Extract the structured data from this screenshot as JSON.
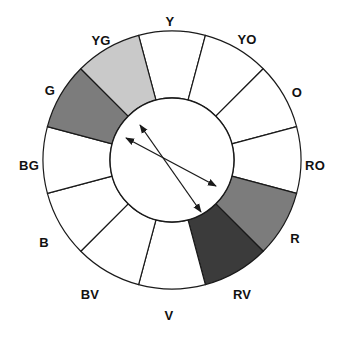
{
  "diagram": {
    "type": "color-wheel",
    "segment_count": 12,
    "geometry": {
      "center_x": 172,
      "center_y": 160,
      "outer_radius": 129,
      "inner_radius": 62,
      "start_angle_deg": -105,
      "segment_span_deg": 30
    },
    "colors": {
      "stroke": "#1a1a1a",
      "background": "#ffffff",
      "empty_segment": "#ffffff",
      "light_gray": "#c9c9c9",
      "medium_gray": "#7c7c7c",
      "dark_gray": "#3b3b3b",
      "label_text": "#111111"
    },
    "segments": [
      {
        "id": "Y",
        "label": "Y",
        "fill_key": "empty_segment",
        "fill": "#ffffff",
        "label_x": 170,
        "label_y": 21,
        "index": 0
      },
      {
        "id": "YO",
        "label": "YO",
        "fill_key": "empty_segment",
        "fill": "#ffffff",
        "label_x": 247,
        "label_y": 39,
        "index": 1
      },
      {
        "id": "O",
        "label": "O",
        "fill_key": "empty_segment",
        "fill": "#ffffff",
        "label_x": 297,
        "label_y": 92,
        "index": 2
      },
      {
        "id": "RO",
        "label": "RO",
        "fill_key": "empty_segment",
        "fill": "#ffffff",
        "label_x": 315,
        "label_y": 165,
        "index": 3
      },
      {
        "id": "R",
        "label": "R",
        "fill_key": "medium_gray",
        "fill": "#7c7c7c",
        "label_x": 295,
        "label_y": 238,
        "index": 4
      },
      {
        "id": "RV",
        "label": "RV",
        "fill_key": "dark_gray",
        "fill": "#3b3b3b",
        "label_x": 242,
        "label_y": 294,
        "index": 5
      },
      {
        "id": "V",
        "label": "V",
        "fill_key": "empty_segment",
        "fill": "#ffffff",
        "label_x": 169,
        "label_y": 315,
        "index": 6
      },
      {
        "id": "BV",
        "label": "BV",
        "fill_key": "empty_segment",
        "fill": "#ffffff",
        "label_x": 90,
        "label_y": 294,
        "index": 7
      },
      {
        "id": "B",
        "label": "B",
        "fill_key": "empty_segment",
        "fill": "#ffffff",
        "label_x": 44,
        "label_y": 242,
        "index": 8
      },
      {
        "id": "BG",
        "label": "BG",
        "fill_key": "empty_segment",
        "fill": "#ffffff",
        "label_x": 29,
        "label_y": 165,
        "index": 9
      },
      {
        "id": "G",
        "label": "G",
        "fill_key": "medium_gray",
        "fill": "#7c7c7c",
        "label_x": 50,
        "label_y": 90,
        "index": 10
      },
      {
        "id": "YG",
        "label": "YG",
        "fill_key": "light_gray",
        "fill": "#c9c9c9",
        "label_x": 101,
        "label_y": 40,
        "index": 11
      }
    ],
    "arrows": [
      {
        "id": "arrow-yg-rv",
        "description": "double-headed arrow linking YG to RV",
        "x1": 140,
        "y1": 125,
        "x2": 201,
        "y2": 212,
        "double_headed": true
      },
      {
        "id": "arrow-g-r",
        "description": "double-headed arrow linking G to R",
        "x1": 126,
        "y1": 138,
        "x2": 216,
        "y2": 186,
        "double_headed": true
      }
    ]
  }
}
